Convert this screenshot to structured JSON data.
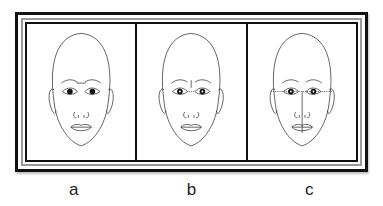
{
  "figure": {
    "panels": [
      {
        "label": "a",
        "guide": "horizontal line between eyebrows"
      },
      {
        "label": "b",
        "guide": "vertical mark between brows with dotted line between eyes"
      },
      {
        "label": "c",
        "guide": "dotted line between eyes with vertical midline to chin"
      }
    ]
  }
}
